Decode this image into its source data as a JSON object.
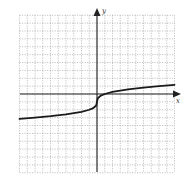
{
  "chart_data": {
    "type": "line",
    "title": "",
    "xlabel": "x",
    "ylabel": "y",
    "xlim": [
      -10,
      10
    ],
    "ylim": [
      -10,
      10
    ],
    "grid": true,
    "grid_step": 1,
    "legend": null,
    "series": [
      {
        "name": "f(x) ≈ ∛x − 1",
        "x": [
          -10,
          -8,
          -6,
          -4,
          -2,
          -1,
          -0.5,
          -0.1,
          0,
          0.1,
          0.5,
          1,
          2,
          4,
          6,
          8,
          10
        ],
        "y": [
          -3.15,
          -3.0,
          -2.82,
          -2.59,
          -2.26,
          -2.0,
          -1.79,
          -1.46,
          -1.0,
          -0.54,
          -0.21,
          0.0,
          0.26,
          0.59,
          0.82,
          1.0,
          1.15
        ]
      }
    ]
  },
  "axes": {
    "x_label": "x",
    "y_label": "y"
  },
  "colors": {
    "curve": "#1a1a1a",
    "axis": "#222222",
    "grid": "#9a9a9a"
  }
}
